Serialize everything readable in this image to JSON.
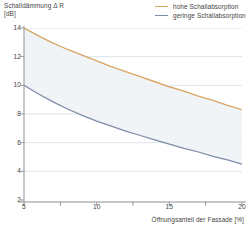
{
  "chart_data": {
    "type": "line",
    "title": "Schalldämmung Δ R [dB]",
    "ylabel_line1": "Schalldämmung Δ R",
    "ylabel_line2": "[dB]",
    "xlabel": "Öffnungsanteil der Fassade [%]",
    "xlim": [
      5,
      20
    ],
    "ylim": [
      2,
      14
    ],
    "xticks": [
      5,
      10,
      15,
      20
    ],
    "xtick_labels": [
      "5",
      "10",
      "15",
      "20"
    ],
    "yticks": [
      2,
      4,
      6,
      8,
      10,
      12,
      14
    ],
    "ytick_labels": [
      "2",
      "4",
      "6",
      "8",
      "10",
      "12",
      "14"
    ],
    "x_minor_ticks": [
      7.5,
      12.5,
      17.5
    ],
    "grid": true,
    "grid_axis": "y",
    "legend_position": "top-right",
    "band_between_series": true,
    "x": [
      5,
      6,
      7,
      8,
      9,
      10,
      11,
      12,
      13,
      14,
      15,
      16,
      17,
      18,
      19,
      20
    ],
    "series": [
      {
        "name": "hohe Schallabsorption",
        "color": "#d9a463",
        "values": [
          14.0,
          13.45,
          12.95,
          12.5,
          12.1,
          11.7,
          11.3,
          10.95,
          10.6,
          10.25,
          9.9,
          9.6,
          9.25,
          8.95,
          8.6,
          8.3
        ]
      },
      {
        "name": "geringe Schallabsorption",
        "color": "#7d8ca8",
        "values": [
          10.0,
          9.4,
          8.85,
          8.35,
          7.9,
          7.5,
          7.15,
          6.8,
          6.5,
          6.2,
          5.9,
          5.6,
          5.35,
          5.05,
          4.8,
          4.5
        ]
      }
    ]
  },
  "legend": {
    "items": [
      {
        "label": "hohe Schallabsorption"
      },
      {
        "label": "geringe Schallabsorption"
      }
    ]
  },
  "colors": {
    "series_high": "#d9a463",
    "series_low": "#7d8ca8",
    "grid": "#d6dde4",
    "axis": "#8f8f8f",
    "band": "#eef2f6",
    "text": "#444444"
  }
}
